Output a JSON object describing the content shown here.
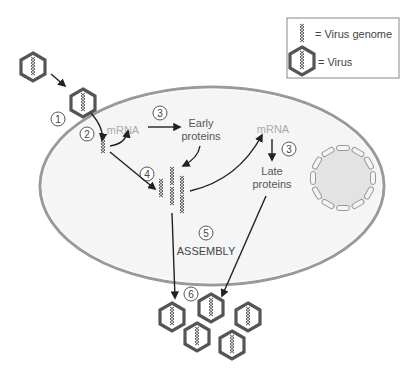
{
  "legend": {
    "genome_label": "= Virus genome",
    "virus_label": "= Virus"
  },
  "labels": {
    "mrna_early": "mRNA",
    "early_proteins_line1": "Early",
    "early_proteins_line2": "proteins",
    "mrna_late": "mRNA",
    "late_proteins_line1": "Late",
    "late_proteins_line2": "proteins",
    "assembly": "ASSEMBLY"
  },
  "steps": [
    "1",
    "2",
    "3",
    "3",
    "4",
    "5",
    "6"
  ],
  "colors": {
    "outline": "#444444",
    "cell_fill": "#f4f4f4",
    "membrane": "#999999",
    "mrna_text": "#aaaaaa",
    "text": "#444444",
    "nucleus_fill": "#e2e2e2"
  }
}
